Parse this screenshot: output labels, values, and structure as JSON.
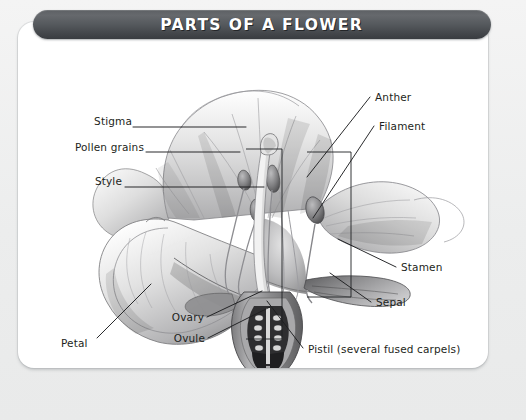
{
  "banner": {
    "title": "PARTS OF A FLOWER",
    "bg_color_dark": "#45484c",
    "bg_color_light": "#66696d",
    "text_color": "#ffffff"
  },
  "card": {
    "background": "#ffffff",
    "page_background": "#eff0f0",
    "corner_radius_px": 16
  },
  "diagram": {
    "style": "graphite-pencil-botanical-illustration",
    "ink_color": "#1d1f21",
    "labels": [
      {
        "id": "stigma",
        "text": "Stigma",
        "side": "left",
        "x": 88,
        "y": 121,
        "anchor_x": 232,
        "anchor_y": 127
      },
      {
        "id": "pollen",
        "text": "Pollen grains",
        "side": "left",
        "x": 60,
        "y": 147,
        "anchor_x": 222,
        "anchor_y": 152
      },
      {
        "id": "style",
        "text": "Style",
        "side": "left",
        "x": 88,
        "y": 181,
        "anchor_x": 246,
        "anchor_y": 187
      },
      {
        "id": "petal",
        "text": "Petal",
        "side": "left",
        "x": 64,
        "y": 342,
        "anchor_x": 133,
        "anchor_y": 284
      },
      {
        "id": "ovary",
        "text": "Ovary",
        "side": "left",
        "x": 171,
        "y": 318,
        "anchor_x": 244,
        "anchor_y": 293
      },
      {
        "id": "ovule",
        "text": "Ovule",
        "side": "left",
        "x": 172,
        "y": 340,
        "anchor_x": 251,
        "anchor_y": 309
      },
      {
        "id": "anther",
        "text": "Anther",
        "side": "right",
        "x": 374,
        "y": 98,
        "anchor_x": 294,
        "anchor_y": 175
      },
      {
        "id": "filament",
        "text": "Filament",
        "side": "right",
        "x": 378,
        "y": 126,
        "anchor_x": 303,
        "anchor_y": 216
      },
      {
        "id": "stamen",
        "text": "Stamen",
        "side": "right",
        "x": 400,
        "y": 268,
        "anchor_x": 330,
        "anchor_y": 238
      },
      {
        "id": "sepal",
        "text": "Sepal",
        "side": "right",
        "x": 375,
        "y": 303,
        "anchor_x": 330,
        "anchor_y": 272
      },
      {
        "id": "pistil",
        "text": "Pistil (several fused carpels)",
        "side": "right",
        "x": 307,
        "y": 350,
        "anchor_x": 268,
        "anchor_y": 299
      }
    ],
    "bracket_boxes": [
      {
        "id": "pistil-bracket",
        "x": 228,
        "y": 127,
        "w": 36,
        "h": 190
      },
      {
        "id": "stamen-bracket",
        "x": 289,
        "y": 130,
        "w": 44,
        "h": 145
      }
    ]
  }
}
